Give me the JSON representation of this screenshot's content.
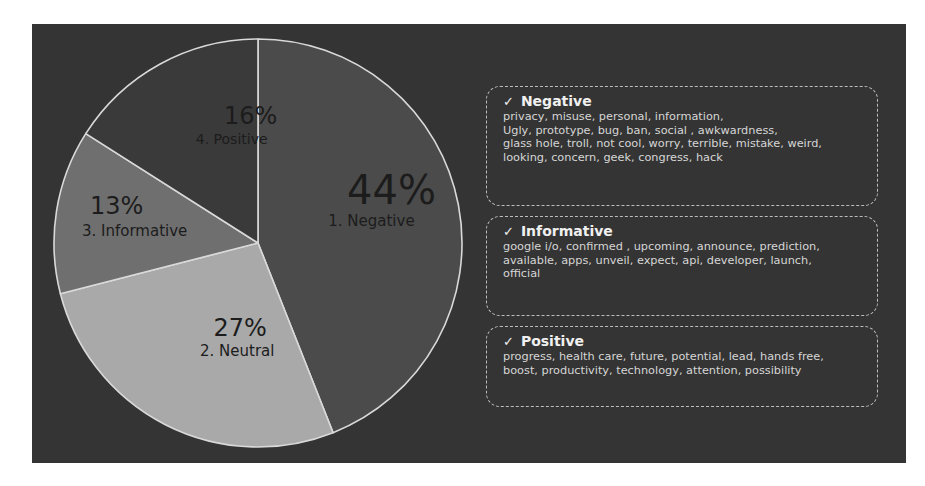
{
  "chart_data": {
    "type": "pie",
    "title": "",
    "start_angle": "12 o'clock",
    "direction": "clockwise",
    "categories": [
      "1. Negative",
      "2. Neutral",
      "3. Informative",
      "4. Positive"
    ],
    "values": [
      44,
      27,
      13,
      16
    ],
    "value_labels": [
      "44%",
      "27%",
      "13%",
      "16%"
    ],
    "colors": [
      "#4b4b4b",
      "#a9a9a9",
      "#6f6f6f",
      "#3a3a3a"
    ],
    "legend": "none (labels inside slices)"
  },
  "slices": [
    {
      "pct": "44%",
      "name": "1. Negative"
    },
    {
      "pct": "27%",
      "name": "2. Neutral"
    },
    {
      "pct": "13%",
      "name": "3. Informative"
    },
    {
      "pct": "16%",
      "name": "4. Positive"
    }
  ],
  "keyword_boxes": [
    {
      "check": "✓",
      "title": "Negative",
      "keywords": "privacy, misuse, personal, information, Ugly, prototype, bug, ban, social , awkwardness, glass hole, troll, not cool, worry, terrible, mistake, weird, looking, concern, geek, congress, hack",
      "lines": [
        "privacy, misuse, personal, information,",
        "Ugly, prototype, bug, ban, social , awkwardness,",
        "glass hole, troll, not cool, worry, terrible, mistake, weird,",
        "looking, concern, geek, congress, hack"
      ]
    },
    {
      "check": "✓",
      "title": "Informative",
      "keywords": "google i/o, confirmed , upcoming, announce, prediction, available, apps, unveil, expect, api, developer, launch, official",
      "lines": [
        "google i/o, confirmed , upcoming, announce, prediction,",
        "available, apps, unveil, expect, api, developer, launch,",
        "official"
      ]
    },
    {
      "check": "✓",
      "title": "Positive",
      "keywords": "progress, health care, future, potential, lead, hands free, boost, productivity, technology, attention, possibility",
      "lines": [
        "progress, health care, future, potential, lead, hands free,",
        "boost, productivity, technology, attention, possibility"
      ]
    }
  ]
}
